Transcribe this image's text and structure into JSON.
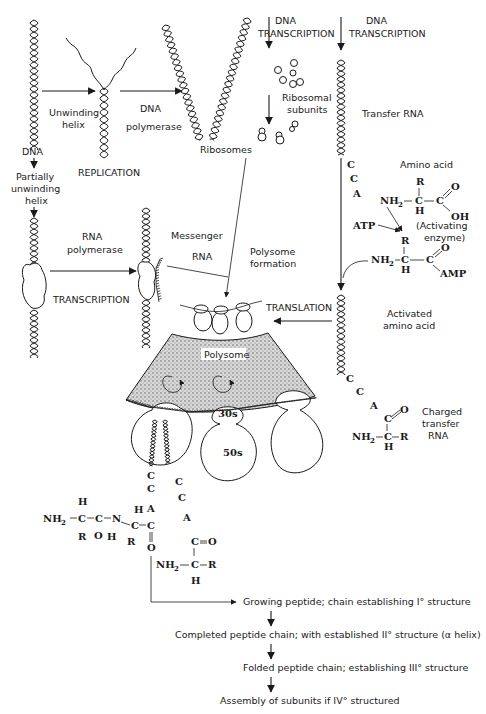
{
  "diagram": {
    "replication": {
      "dna_label": "DNA",
      "unwinding_helix": [
        "Unwinding",
        "helix"
      ],
      "dna_polymerase": [
        "DNA",
        "polymerase"
      ],
      "replication_label": "REPLICATION",
      "ribosomes_label": "Ribosomes"
    },
    "transcription_left": {
      "partially_unwinding_helix": [
        "Partially",
        "unwinding",
        "helix"
      ],
      "rna_polymerase": [
        "RNA",
        "polymerase"
      ],
      "transcription_label": "TRANSCRIPTION",
      "messenger_rna": [
        "Messenger",
        "RNA"
      ],
      "polysome_formation": [
        "Polysome",
        "formation"
      ]
    },
    "ribosomal": {
      "dna_transcription": [
        "DNA",
        "TRANSCRIPTION"
      ],
      "ribosomal_subunits": [
        "Ribosomal",
        "subunits"
      ]
    },
    "transfer": {
      "dna_transcription": [
        "DNA",
        "TRANSCRIPTION"
      ],
      "transfer_rna": "Transfer RNA",
      "cca": [
        "C",
        "C",
        "A"
      ],
      "amino_acid_label": "Amino acid",
      "atp": "ATP",
      "activating_enzyme": [
        "(Activating",
        "enzyme)"
      ],
      "amino_acid_formula": {
        "nh2": "NH",
        "sub2": "2",
        "c": "C",
        "r": "R",
        "h": "H",
        "cooh_c": "C",
        "o": "O",
        "oh": "OH"
      },
      "activated_formula": {
        "nh2": "NH",
        "sub2": "2",
        "c": "C",
        "r": "R",
        "h": "H",
        "c2": "C",
        "o": "O",
        "amp": "AMP"
      },
      "activated_label": [
        "Activated",
        "amino acid"
      ],
      "translation_label": "TRANSLATION",
      "charged_trna_label": [
        "Charged",
        "transfer",
        "RNA"
      ],
      "charged_cca": [
        "C",
        "C",
        "A",
        "C",
        "O"
      ],
      "charged_formula": {
        "nh2": "NH",
        "sub2": "2",
        "c": "C",
        "r": "R",
        "h": "H"
      }
    },
    "polysome": {
      "label": "Polysome",
      "subunit_30s": "30s",
      "subunit_50s": "50s"
    },
    "peptide": {
      "left_chain": {
        "nh2": "NH",
        "sub2": "2",
        "c1": "C",
        "h1": "H",
        "r1": "R",
        "c2": "C",
        "o1": "O",
        "n": "N",
        "h_n": "H",
        "c3": "C",
        "h3": "H",
        "r3": "R",
        "c4": "C",
        "o4": "O"
      },
      "trna_left_cca": [
        "C",
        "C",
        "A"
      ],
      "trna_right_cca": [
        "C",
        "C",
        "A"
      ],
      "right_chain": {
        "c": "C",
        "o": "O",
        "nh2": "NH",
        "sub2": "2",
        "ca": "C",
        "r": "R",
        "h": "H"
      }
    },
    "flow": [
      "Growing peptide; chain establishing I° structure",
      "Completed peptide chain; with established II° structure (α helix)",
      "Folded peptide chain; establishing III° structure",
      "Assembly of subunits if IV° structured"
    ]
  }
}
